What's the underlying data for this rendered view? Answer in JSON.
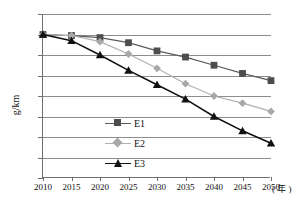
{
  "chart_data": {
    "type": "line",
    "title": "",
    "xlabel": "年",
    "ylabel": "g/km",
    "x": [
      2010,
      2015,
      2020,
      2025,
      2030,
      2035,
      2040,
      2045,
      2050
    ],
    "xticklabels": [
      "2010",
      "2015",
      "2020",
      "2025",
      "2030",
      "2035",
      "2040",
      "2045",
      "2050"
    ],
    "xlim": [
      2010,
      2050
    ],
    "ylim": [
      20,
      180
    ],
    "yticks": [
      20,
      40,
      60,
      80,
      100,
      120,
      140,
      160,
      180
    ],
    "yticklabels": [
      "20",
      "40",
      "60",
      "80",
      "100",
      "120",
      "140",
      "160",
      "180"
    ],
    "grid": "horizontal",
    "legend_position": "inside-left",
    "series": [
      {
        "name": "E1",
        "marker": "square",
        "color": "#4d4d4d",
        "line_color": "#5a5a5a",
        "values": [
          160,
          159,
          157,
          152,
          144,
          138,
          130,
          122,
          115
        ]
      },
      {
        "name": "E2",
        "marker": "diamond",
        "color": "#a8a8a8",
        "line_color": "#b0b0b0",
        "values": [
          160,
          159,
          153,
          141,
          127,
          112,
          100,
          93,
          85
        ]
      },
      {
        "name": "E3",
        "marker": "triangle",
        "color": "#111111",
        "line_color": "#111111",
        "values": [
          160,
          154,
          140,
          125,
          111,
          97,
          80,
          66,
          54
        ]
      }
    ]
  },
  "axis": {
    "x_unit_label": "( 年 )",
    "y_axis_title": "g/km"
  },
  "legend": {
    "entries": [
      {
        "label": "E1"
      },
      {
        "label": "E2"
      },
      {
        "label": "E3"
      }
    ]
  },
  "colors": {
    "grid": "#8d8d8d",
    "axis": "#6f6f6f",
    "background": "#ffffff",
    "series_e1": "#4d4d4d",
    "series_e2": "#a8a8a8",
    "series_e3": "#111111"
  }
}
